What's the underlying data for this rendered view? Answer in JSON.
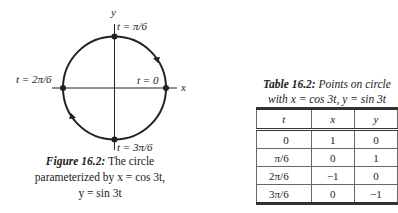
{
  "figure": {
    "axis_labels": {
      "x": "x",
      "y": "y"
    },
    "points": [
      {
        "label": "t = 0",
        "x": 1,
        "y": 0
      },
      {
        "label": "t = π/6",
        "x": 0,
        "y": 1
      },
      {
        "label": "t = 2π/6",
        "x": -1,
        "y": 0
      },
      {
        "label": "t = 3π/6",
        "x": 0,
        "y": -1
      }
    ],
    "direction": "counterclockwise",
    "caption": {
      "label": "Figure 16.2:",
      "line1_rest": "The circle",
      "line2": "parameterized by x = cos 3t,",
      "line3": "y = sin 3t"
    }
  },
  "table": {
    "title_label": "Table 16.2:",
    "title_rest": "Points on circle",
    "title_line2": "with x = cos 3t, y = sin 3t",
    "headers": [
      "t",
      "x",
      "y"
    ],
    "rows": [
      [
        "0",
        "1",
        "0"
      ],
      [
        "π/6",
        "0",
        "1"
      ],
      [
        "2π/6",
        "−1",
        "0"
      ],
      [
        "3π/6",
        "0",
        "−1"
      ]
    ]
  }
}
